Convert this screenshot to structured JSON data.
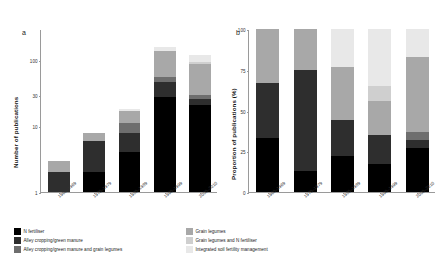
{
  "figure": {
    "panels": [
      {
        "letter": "a"
      },
      {
        "letter": "b"
      }
    ]
  },
  "chart_data": [
    {
      "type": "bar",
      "panel": "a",
      "title": "",
      "xlabel": "",
      "ylabel": "Number of publications",
      "yscale": "log",
      "ylim": [
        1,
        300
      ],
      "yticks": [
        1,
        10,
        30,
        100
      ],
      "yticklabels": [
        "1",
        "10",
        "30",
        "100"
      ],
      "grid": false,
      "legend_position": "bottom",
      "stacked": true,
      "categories": [
        "1960–1969",
        "1970–1979",
        "1980–1989",
        "1990–1999",
        "2000–2010"
      ],
      "series": [
        {
          "name": "N fertiliser",
          "values": [
            1,
            2,
            4,
            28,
            21
          ]
        },
        {
          "name": "Alley cropping/green manure",
          "values": [
            1,
            4,
            4,
            19,
            5
          ]
        },
        {
          "name": "Alley cropping/green manure and grain legumes",
          "values": [
            0,
            0,
            3,
            9,
            4
          ]
        },
        {
          "name": "Grain legumes",
          "values": [
            1,
            2,
            6,
            82,
            57
          ]
        },
        {
          "name": "Grain legumes and N fertiliser",
          "values": [
            0,
            0,
            0,
            0,
            8
          ]
        },
        {
          "name": "Integrated soil fertility management",
          "values": [
            0,
            0,
            1,
            22,
            24
          ]
        }
      ],
      "totals": [
        3,
        8,
        18,
        160,
        119
      ]
    },
    {
      "type": "bar",
      "panel": "b",
      "title": "",
      "xlabel": "",
      "ylabel": "Proportion of publications (%)",
      "yscale": "linear",
      "ylim": [
        0,
        100
      ],
      "yticks": [
        0,
        25,
        50,
        75,
        100
      ],
      "yticklabels": [
        "0",
        "25",
        "50",
        "75",
        "100"
      ],
      "grid": false,
      "legend_position": "bottom",
      "stacked": true,
      "categories": [
        "1960–1969",
        "1970–1979",
        "1980–1989",
        "1990–1999",
        "2000–2010"
      ],
      "series": [
        {
          "name": "N fertiliser",
          "values": [
            33,
            13,
            22,
            17,
            27
          ]
        },
        {
          "name": "Alley cropping/green manure",
          "values": [
            34,
            62,
            22,
            18,
            5
          ]
        },
        {
          "name": "Alley cropping/green manure and grain legumes",
          "values": [
            0,
            0,
            0,
            0,
            5
          ]
        },
        {
          "name": "Grain legumes",
          "values": [
            33,
            25,
            33,
            21,
            46
          ]
        },
        {
          "name": "Grain legumes and N fertiliser",
          "values": [
            0,
            0,
            0,
            9,
            0
          ]
        },
        {
          "name": "Integrated soil fertility management",
          "values": [
            0,
            0,
            23,
            35,
            17
          ]
        }
      ]
    }
  ],
  "legend": {
    "column_1": [
      {
        "label": "N fertiliser",
        "color": "#000000"
      },
      {
        "label": "Alley cropping/green manure",
        "color": "#2e2e2e"
      },
      {
        "label": "Alley cropping/green manure and grain legumes",
        "color": "#6e6e6e"
      }
    ],
    "column_2": [
      {
        "label": "Grain legumes",
        "color": "#a8a8a8"
      },
      {
        "label": "Grain legumes and N fertiliser",
        "color": "#cfcfcf"
      },
      {
        "label": "Integrated soil fertility management",
        "color": "#e8e8e8"
      }
    ]
  },
  "colors": {
    "n_fertiliser": "#000000",
    "alley_cropping": "#2e2e2e",
    "alley_cropping_grain_legumes": "#6e6e6e",
    "grain_legumes": "#a8a8a8",
    "grain_legumes_n_fertiliser": "#cfcfcf",
    "isfm": "#e8e8e8",
    "axis": "#9a9a9a",
    "text": "#1a1a1a",
    "background": "#ffffff"
  }
}
